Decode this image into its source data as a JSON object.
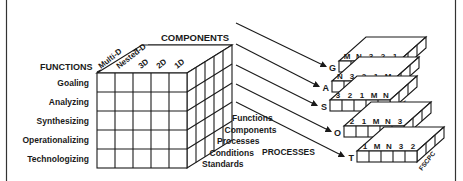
{
  "diagram": {
    "components_label": "COMPONENTS",
    "functions_label": "FUNCTIONS",
    "processes_label": "PROCESSES",
    "components": [
      "Multi-D",
      "Nested-D",
      "3D",
      "2D",
      "1D"
    ],
    "functions": [
      "Goaling",
      "Analyzing",
      "Synthesizing",
      "Operationalizing",
      "Technologizing"
    ],
    "processes": [
      "Functions",
      "Components",
      "Processes",
      "Conditions",
      "Standards"
    ],
    "slabs": [
      {
        "letter": "G",
        "top": [
          "M",
          "N",
          "3",
          "2",
          "1"
        ],
        "side": "SCPCF"
      },
      {
        "letter": "A",
        "top": [
          "N",
          "3",
          "2",
          "1",
          "M"
        ],
        "side": "CPCFS"
      },
      {
        "letter": "S",
        "top": [
          "3",
          "2",
          "1",
          "M",
          "N"
        ],
        "side": "PCFSC"
      },
      {
        "letter": "O",
        "top": [
          "2",
          "1",
          "M",
          "N",
          "3"
        ],
        "side": "CFSCP"
      },
      {
        "letter": "T",
        "top": [
          "1",
          "M",
          "N",
          "3",
          "2"
        ],
        "side": "FSCPC"
      }
    ]
  }
}
